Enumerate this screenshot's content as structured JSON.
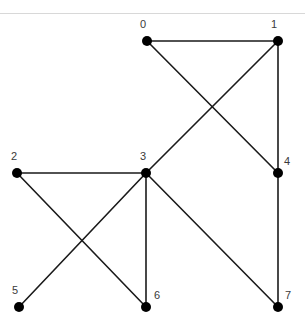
{
  "header": {
    "clipped_text": "",
    "divider_color": "#d8d8d8"
  },
  "figure": {
    "background_color": "#ffffff",
    "node_color": "#000000",
    "edge_color": "#1a1a1a",
    "label_color": "#3a3a3a",
    "node_radius": 5,
    "edge_width": 1.6
  },
  "chart_data": {
    "type": "diagram",
    "subtype": "undirected-graph-node-link",
    "title": "",
    "xlabel": "",
    "ylabel": "",
    "grid": false,
    "legend": null,
    "node_count": 8,
    "edge_count": 10,
    "nodes": [
      {
        "id": "0",
        "label": "0",
        "x": 147,
        "y": 41,
        "label_x": 143,
        "label_y": 28,
        "label_anchor": "middle"
      },
      {
        "id": "1",
        "label": "1",
        "x": 278,
        "y": 41,
        "label_x": 274,
        "label_y": 28,
        "label_anchor": "middle"
      },
      {
        "id": "2",
        "label": "2",
        "x": 17,
        "y": 173,
        "label_x": 14,
        "label_y": 160,
        "label_anchor": "middle"
      },
      {
        "id": "3",
        "label": "3",
        "x": 146,
        "y": 173,
        "label_x": 143,
        "label_y": 160,
        "label_anchor": "middle"
      },
      {
        "id": "4",
        "label": "4",
        "x": 278,
        "y": 173,
        "label_x": 287,
        "label_y": 165,
        "label_anchor": "middle"
      },
      {
        "id": "5",
        "label": "5",
        "x": 19,
        "y": 307,
        "label_x": 15,
        "label_y": 294,
        "label_anchor": "middle"
      },
      {
        "id": "6",
        "label": "6",
        "x": 146,
        "y": 307,
        "label_x": 157,
        "label_y": 299,
        "label_anchor": "middle"
      },
      {
        "id": "7",
        "label": "7",
        "x": 278,
        "y": 307,
        "label_x": 288,
        "label_y": 299,
        "label_anchor": "middle"
      }
    ],
    "edges": [
      {
        "source": "0",
        "target": "1",
        "x1": 147,
        "y1": 41,
        "x2": 278,
        "y2": 41
      },
      {
        "source": "0",
        "target": "4",
        "x1": 147,
        "y1": 41,
        "x2": 278,
        "y2": 173
      },
      {
        "source": "1",
        "target": "3",
        "x1": 278,
        "y1": 41,
        "x2": 146,
        "y2": 173
      },
      {
        "source": "1",
        "target": "4",
        "x1": 278,
        "y1": 41,
        "x2": 278,
        "y2": 173
      },
      {
        "source": "2",
        "target": "3",
        "x1": 17,
        "y1": 173,
        "x2": 146,
        "y2": 173
      },
      {
        "source": "2",
        "target": "6",
        "x1": 17,
        "y1": 173,
        "x2": 146,
        "y2": 307
      },
      {
        "source": "3",
        "target": "5",
        "x1": 146,
        "y1": 173,
        "x2": 19,
        "y2": 307
      },
      {
        "source": "3",
        "target": "6",
        "x1": 146,
        "y1": 173,
        "x2": 146,
        "y2": 307
      },
      {
        "source": "3",
        "target": "7",
        "x1": 146,
        "y1": 173,
        "x2": 278,
        "y2": 307
      },
      {
        "source": "4",
        "target": "7",
        "x1": 278,
        "y1": 173,
        "x2": 278,
        "y2": 307
      }
    ],
    "adjacency": {
      "0": [
        "1",
        "4"
      ],
      "1": [
        "0",
        "3",
        "4"
      ],
      "2": [
        "3",
        "6"
      ],
      "3": [
        "1",
        "2",
        "5",
        "6",
        "7"
      ],
      "4": [
        "0",
        "1",
        "7"
      ],
      "5": [
        "3"
      ],
      "6": [
        "2",
        "3"
      ],
      "7": [
        "3",
        "4"
      ]
    }
  }
}
